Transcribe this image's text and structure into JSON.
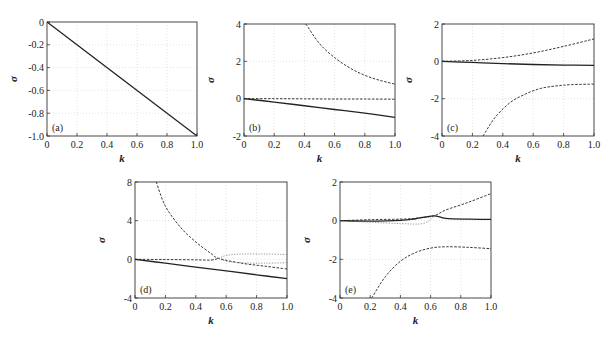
{
  "chart_data": [
    {
      "type": "line",
      "panel_label": "(a)",
      "xlabel": "k",
      "ylabel": "σ",
      "xlim": [
        0,
        1.0
      ],
      "ylim": [
        -1.0,
        0
      ],
      "xticks": [
        "0",
        "0.2",
        "0.4",
        "0.6",
        "0.8",
        "1.0"
      ],
      "xtick_values": [
        0,
        0.2,
        0.4,
        0.6,
        0.8,
        1.0
      ],
      "yticks": [
        "-1.0",
        "-0.8",
        "-0.6",
        "-0.4",
        "-0.2",
        "0"
      ],
      "ytick_values": [
        -1.0,
        -0.8,
        -0.6,
        -0.4,
        -0.2,
        0
      ],
      "grid": true,
      "series": [
        {
          "name": "solid",
          "style": "solid",
          "x": [
            0,
            1.0
          ],
          "y": [
            0,
            -1.0
          ]
        }
      ]
    },
    {
      "type": "line",
      "panel_label": "(b)",
      "xlabel": "k",
      "ylabel": "σ",
      "xlim": [
        0,
        1.0
      ],
      "ylim": [
        -2,
        4
      ],
      "xticks": [
        "0",
        "0.2",
        "0.4",
        "0.6",
        "0.8",
        "1.0"
      ],
      "xtick_values": [
        0,
        0.2,
        0.4,
        0.6,
        0.8,
        1.0
      ],
      "yticks": [
        "-2",
        "0",
        "2",
        "4"
      ],
      "ytick_values": [
        -2,
        0,
        2,
        4
      ],
      "grid": true,
      "series": [
        {
          "name": "solid",
          "style": "solid",
          "x": [
            0,
            0.2,
            0.4,
            0.6,
            0.8,
            1.0
          ],
          "y": [
            0,
            -0.18,
            -0.38,
            -0.58,
            -0.78,
            -1.0
          ]
        },
        {
          "name": "dashed-zero",
          "style": "dashed",
          "x": [
            0,
            0.2,
            0.4,
            0.6,
            0.8,
            1.0
          ],
          "y": [
            0,
            0,
            -0.01,
            -0.02,
            -0.02,
            -0.03
          ]
        },
        {
          "name": "dashed-upper",
          "style": "dashed",
          "x": [
            0.41,
            0.5,
            0.6,
            0.7,
            0.8,
            0.9,
            1.0
          ],
          "y": [
            4.0,
            2.95,
            2.2,
            1.65,
            1.25,
            0.98,
            0.78
          ]
        }
      ]
    },
    {
      "type": "line",
      "panel_label": "(c)",
      "xlabel": "k",
      "ylabel": "σ",
      "xlim": [
        0,
        1.0
      ],
      "ylim": [
        -4,
        2
      ],
      "xticks": [
        "0",
        "0.2",
        "0.4",
        "0.6",
        "0.8",
        "1.0"
      ],
      "xtick_values": [
        0,
        0.2,
        0.4,
        0.6,
        0.8,
        1.0
      ],
      "yticks": [
        "-4",
        "-2",
        "0",
        "2"
      ],
      "ytick_values": [
        -4,
        -2,
        0,
        2
      ],
      "grid": true,
      "series": [
        {
          "name": "solid",
          "style": "solid",
          "x": [
            0,
            0.2,
            0.4,
            0.6,
            0.8,
            1.0
          ],
          "y": [
            0,
            -0.06,
            -0.12,
            -0.17,
            -0.2,
            -0.22
          ]
        },
        {
          "name": "dashed-upper",
          "style": "dashed",
          "x": [
            0,
            0.2,
            0.4,
            0.6,
            0.8,
            1.0
          ],
          "y": [
            0,
            0.05,
            0.2,
            0.45,
            0.8,
            1.2
          ]
        },
        {
          "name": "dashed-lower",
          "style": "dashed",
          "x": [
            0.27,
            0.35,
            0.45,
            0.55,
            0.65,
            0.75,
            0.85,
            1.0
          ],
          "y": [
            -4.0,
            -3.0,
            -2.2,
            -1.75,
            -1.45,
            -1.32,
            -1.25,
            -1.22
          ]
        }
      ]
    },
    {
      "type": "line",
      "panel_label": "(d)",
      "xlabel": "k",
      "ylabel": "σ",
      "xlim": [
        0,
        1.0
      ],
      "ylim": [
        -4,
        8
      ],
      "xticks": [
        "0",
        "0.2",
        "0.4",
        "0.6",
        "0.8",
        "1.0"
      ],
      "xtick_values": [
        0,
        0.2,
        0.4,
        0.6,
        0.8,
        1.0
      ],
      "yticks": [
        "-4",
        "0",
        "4",
        "8"
      ],
      "ytick_values": [
        -4,
        0,
        4,
        8
      ],
      "grid": true,
      "series": [
        {
          "name": "solid",
          "style": "solid",
          "x": [
            0,
            0.2,
            0.4,
            0.6,
            0.8,
            1.0
          ],
          "y": [
            0,
            -0.4,
            -0.8,
            -1.2,
            -1.6,
            -2.0
          ]
        },
        {
          "name": "dashed-upper",
          "style": "dashed",
          "x": [
            0.14,
            0.2,
            0.3,
            0.4,
            0.5,
            0.55,
            0.7,
            0.85,
            1.0
          ],
          "y": [
            8.0,
            5.5,
            3.3,
            1.8,
            0.6,
            0.1,
            -0.4,
            -0.7,
            -1.0
          ]
        },
        {
          "name": "dashed-zero",
          "style": "dashed",
          "x": [
            0,
            0.2,
            0.4,
            0.5,
            0.55
          ],
          "y": [
            0,
            -0.02,
            -0.05,
            -0.08,
            0.1
          ]
        },
        {
          "name": "dotted-branch-upper",
          "style": "dotted",
          "x": [
            0.55,
            0.6,
            0.7,
            0.85,
            1.0
          ],
          "y": [
            0.1,
            0.4,
            0.55,
            0.55,
            0.5
          ]
        },
        {
          "name": "dotted-branch-lower",
          "style": "dotted",
          "x": [
            0.55,
            0.6,
            0.7,
            0.85,
            1.0
          ],
          "y": [
            0.1,
            -0.2,
            -0.35,
            -0.4,
            -0.35
          ]
        }
      ]
    },
    {
      "type": "line",
      "panel_label": "(e)",
      "xlabel": "k",
      "ylabel": "σ",
      "xlim": [
        0,
        1.0
      ],
      "ylim": [
        -4,
        2
      ],
      "xticks": [
        "0",
        "0.2",
        "0.4",
        "0.6",
        "0.8",
        "1.0"
      ],
      "xtick_values": [
        0,
        0.2,
        0.4,
        0.6,
        0.8,
        1.0
      ],
      "yticks": [
        "-4",
        "-2",
        "0",
        "2"
      ],
      "ytick_values": [
        -4,
        -2,
        0,
        2
      ],
      "grid": true,
      "series": [
        {
          "name": "solid",
          "style": "solid",
          "x": [
            0,
            0.2,
            0.4,
            0.5,
            0.62,
            0.7,
            0.85,
            1.0
          ],
          "y": [
            0,
            -0.02,
            0.02,
            0.1,
            0.25,
            0.12,
            0.08,
            0.07
          ]
        },
        {
          "name": "dashed-upper",
          "style": "dashed",
          "x": [
            0,
            0.2,
            0.4,
            0.5,
            0.62,
            0.7,
            0.85,
            1.0
          ],
          "y": [
            0,
            0.05,
            0.08,
            0.12,
            0.25,
            0.55,
            0.95,
            1.4
          ]
        },
        {
          "name": "dotted-lower-near-zero",
          "style": "dotted",
          "x": [
            0,
            0.2,
            0.4,
            0.55,
            0.62
          ],
          "y": [
            0,
            -0.08,
            -0.15,
            -0.15,
            0.2
          ]
        },
        {
          "name": "dashed-lower",
          "style": "dashed",
          "x": [
            0.21,
            0.3,
            0.4,
            0.5,
            0.6,
            0.7,
            0.85,
            1.0
          ],
          "y": [
            -4.0,
            -2.9,
            -2.1,
            -1.65,
            -1.42,
            -1.35,
            -1.38,
            -1.45
          ]
        }
      ]
    }
  ]
}
